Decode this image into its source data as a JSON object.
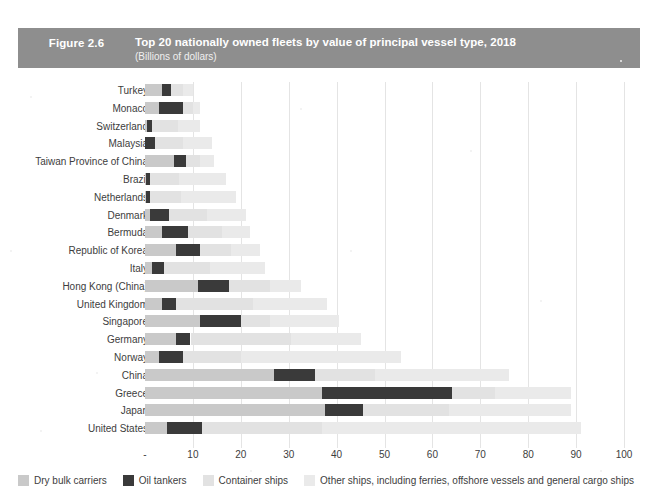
{
  "header": {
    "figure_number": "Figure 2.6",
    "title": "Top 20 nationally owned fleets by value of principal vessel type, 2018",
    "subtitle": "(Billions of dollars)",
    "banner_color": "#8e8e8e"
  },
  "legend": {
    "items": [
      {
        "label": "Dry bulk carriers",
        "color": "#c9c9c9",
        "key": "dry"
      },
      {
        "label": "Oil tankers",
        "color": "#3a3a3a",
        "key": "oil"
      },
      {
        "label": "Container ships",
        "color": "#e2e2e2",
        "key": "cont"
      },
      {
        "label": "Other ships, including ferries, offshore vessels and general cargo ships",
        "color": "#eaeaea",
        "key": "other"
      }
    ]
  },
  "chart_data": {
    "type": "bar",
    "orientation": "horizontal",
    "stacked": true,
    "title": "Top 20 nationally owned fleets by value of principal vessel type, 2018",
    "subtitle": "(Billions of dollars)",
    "xlabel": "",
    "ylabel": "",
    "xlim": [
      0,
      100
    ],
    "xticks": [
      "-",
      "10",
      "20",
      "30",
      "40",
      "50",
      "60",
      "70",
      "80",
      "90",
      "100"
    ],
    "xtick_values": [
      0,
      10,
      20,
      30,
      40,
      50,
      60,
      70,
      80,
      90,
      100
    ],
    "grid": true,
    "legend_position": "bottom",
    "series": [
      {
        "name": "Dry bulk carriers",
        "color": "#c9c9c9",
        "values": [
          3.5,
          3.0,
          0.4,
          0.0,
          6.0,
          0.3,
          0.3,
          1.0,
          3.5,
          6.5,
          1.5,
          11.0,
          3.5,
          11.5,
          6.5,
          3.0,
          27.0,
          37.0,
          37.5,
          4.5
        ]
      },
      {
        "name": "Oil tankers",
        "color": "#3a3a3a",
        "values": [
          2.0,
          5.0,
          1.0,
          2.0,
          2.5,
          0.8,
          0.8,
          4.0,
          5.5,
          5.0,
          2.5,
          6.5,
          3.0,
          8.5,
          3.0,
          5.0,
          8.5,
          27.0,
          8.0,
          7.5
        ]
      },
      {
        "name": "Container ships",
        "color": "#e2e2e2",
        "values": [
          2.5,
          2.0,
          5.5,
          6.0,
          3.0,
          6.0,
          6.5,
          8.0,
          7.0,
          6.5,
          9.5,
          8.5,
          16.0,
          6.0,
          21.0,
          12.0,
          12.5,
          9.0,
          18.0,
          25.0
        ]
      },
      {
        "name": "Other ships, including ferries, offshore vessels and general cargo ships",
        "color": "#eaeaea",
        "values": [
          2.0,
          1.5,
          4.6,
          6.0,
          3.0,
          9.9,
          11.4,
          8.0,
          6.0,
          6.0,
          11.5,
          6.5,
          15.5,
          14.5,
          14.5,
          33.5,
          28.0,
          16.0,
          25.5,
          54.0
        ]
      }
    ],
    "categories": [
      "Turkey",
      "Monaco",
      "Switzerland",
      "Malaysia",
      "Taiwan Province of China",
      "Brazil",
      "Netherlands",
      "Denmark",
      "Bermuda",
      "Republic of Korea",
      "Italy",
      "Hong Kong (China)",
      "United Kingdom",
      "Singapore",
      "Germany",
      "Norway",
      "China",
      "Greece",
      "Japan",
      "United States"
    ],
    "totals": [
      10.0,
      11.5,
      11.5,
      14.0,
      14.5,
      17.0,
      19.0,
      21.0,
      22.0,
      24.0,
      25.0,
      32.5,
      38.0,
      40.5,
      45.0,
      53.5,
      76.0,
      89.0,
      89.0,
      91.0
    ]
  }
}
